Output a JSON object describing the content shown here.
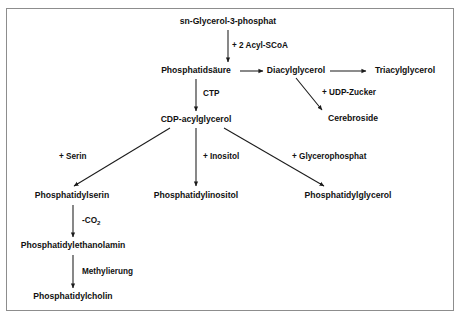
{
  "diagram": {
    "title_node": "sn-Glycerol-3-phosphat",
    "nodes": [
      {
        "id": "glycerol3p",
        "label": "sn-Glycerol-3-phosphat",
        "x": 228,
        "y": 22,
        "anchor": "middle"
      },
      {
        "id": "phosphatidsaeure",
        "label": "Phosphatidsäure",
        "x": 196,
        "y": 71,
        "anchor": "middle"
      },
      {
        "id": "diacylglycerol",
        "label": "Diacylglycerol",
        "x": 296,
        "y": 71,
        "anchor": "middle"
      },
      {
        "id": "triacylglycerol",
        "label": "Triacylglycerol",
        "x": 405,
        "y": 71,
        "anchor": "middle"
      },
      {
        "id": "cerebroside",
        "label": "Cerebroside",
        "x": 353,
        "y": 119,
        "anchor": "middle"
      },
      {
        "id": "cdp-acylglycerol",
        "label": "CDP-acylglycerol",
        "x": 196,
        "y": 120,
        "anchor": "middle"
      },
      {
        "id": "phosphatidylserin",
        "label": "Phosphatidylserin",
        "x": 72,
        "y": 196,
        "anchor": "middle"
      },
      {
        "id": "phosphatidylinositol",
        "label": "Phosphatidylinositol",
        "x": 196,
        "y": 196,
        "anchor": "middle"
      },
      {
        "id": "phosphatidylglycerol",
        "label": "Phosphatidylglycerol",
        "x": 348,
        "y": 196,
        "anchor": "middle"
      },
      {
        "id": "phosphatidylethanolamin",
        "label": "Phosphatidylethanolamin",
        "x": 73,
        "y": 246,
        "anchor": "middle"
      },
      {
        "id": "phosphatidylcholin",
        "label": "Phosphatidylcholin",
        "x": 73,
        "y": 297,
        "anchor": "middle"
      }
    ],
    "edge_labels": [
      {
        "id": "acyl-scoa",
        "label": "+ 2 Acyl-SCoA",
        "x": 232,
        "y": 46
      },
      {
        "id": "ctp",
        "label": "CTP",
        "x": 203,
        "y": 94
      },
      {
        "id": "udp-zucker",
        "label": "+ UDP-Zucker",
        "x": 322,
        "y": 93
      },
      {
        "id": "serin",
        "label": "+ Serin",
        "x": 59,
        "y": 157
      },
      {
        "id": "inositol",
        "label": "+ Inositol",
        "x": 203,
        "y": 157
      },
      {
        "id": "glycerophosphat",
        "label": "+ Glycerophosphat",
        "x": 292,
        "y": 157
      },
      {
        "id": "co2",
        "label": "-CO",
        "subscript": "2",
        "x": 82,
        "y": 221
      },
      {
        "id": "methylierung",
        "label": "Methylierung",
        "x": 82,
        "y": 272
      }
    ],
    "colors": {
      "background": "#ffffff",
      "stroke": "#1b1b1b",
      "text": "#111111",
      "frame": "#8d8d8d"
    }
  }
}
